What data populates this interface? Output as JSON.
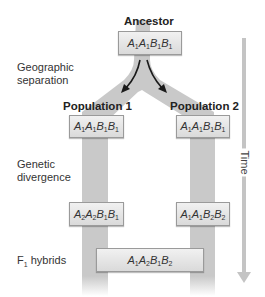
{
  "ancestor": {
    "label": "Ancestor",
    "genotype": [
      [
        "A",
        "1"
      ],
      [
        "A",
        "1"
      ],
      [
        "B",
        "1"
      ],
      [
        "B",
        "1"
      ]
    ]
  },
  "stages": {
    "geographic_separation": [
      "Geographic",
      "separation"
    ],
    "genetic_divergence": [
      "Genetic",
      "divergence"
    ],
    "f1_hybrids": {
      "prefix": "F",
      "sub": "1",
      "rest": " hybrids"
    }
  },
  "population1": {
    "label": "Population 1",
    "initial_genotype": [
      [
        "A",
        "1"
      ],
      [
        "A",
        "1"
      ],
      [
        "B",
        "1"
      ],
      [
        "B",
        "1"
      ]
    ],
    "diverged_genotype": [
      [
        "A",
        "2"
      ],
      [
        "A",
        "2"
      ],
      [
        "B",
        "1"
      ],
      [
        "B",
        "1"
      ]
    ]
  },
  "population2": {
    "label": "Population 2",
    "initial_genotype": [
      [
        "A",
        "1"
      ],
      [
        "A",
        "1"
      ],
      [
        "B",
        "1"
      ],
      [
        "B",
        "1"
      ]
    ],
    "diverged_genotype": [
      [
        "A",
        "1"
      ],
      [
        "A",
        "1"
      ],
      [
        "B",
        "2"
      ],
      [
        "B",
        "2"
      ]
    ]
  },
  "hybrid": {
    "genotype": [
      [
        "A",
        "1"
      ],
      [
        "A",
        "2"
      ],
      [
        "B",
        "1"
      ],
      [
        "B",
        "2"
      ]
    ]
  },
  "time_axis": {
    "label": "Time",
    "direction": "down"
  },
  "colors": {
    "band": "#c9c9c9",
    "arrow": "#1a1a1a",
    "time_arrow": "#c4c4c4",
    "box_border": "#9a9a9a"
  }
}
